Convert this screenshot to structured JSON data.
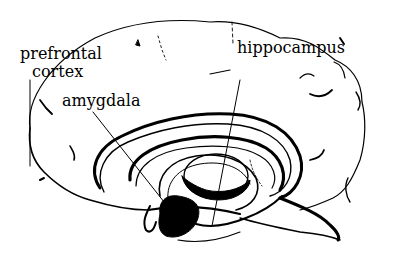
{
  "diagram": {
    "labels": [
      {
        "id": "prefrontal",
        "lines": [
          "prefrontal",
          "cortex"
        ]
      },
      {
        "id": "amygdala",
        "text": "amygdala"
      },
      {
        "id": "hippocampus",
        "text": "hippocampus"
      }
    ]
  },
  "colors": {
    "ink": "#000000",
    "background": "#ffffff"
  }
}
